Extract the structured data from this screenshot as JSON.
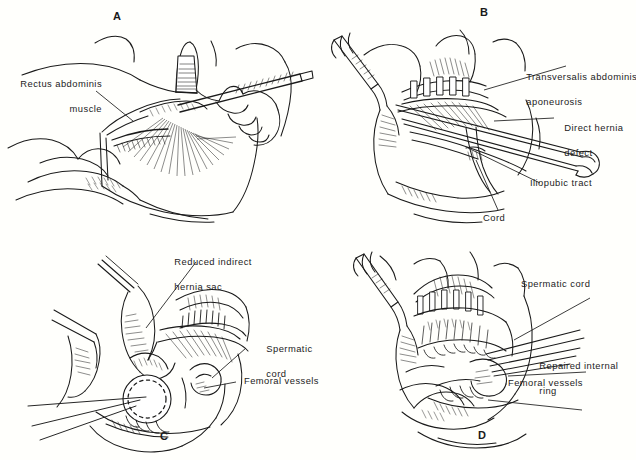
{
  "figure": {
    "background_color": "#fffffc",
    "ink_color": "#1a1a1a",
    "text_color": "#1c1c1c"
  },
  "panels": [
    {
      "id": "A",
      "letter": "A",
      "letter_position": "top",
      "caption": "Rectus abdominis muscle exposed; surgeon incises with scalpel",
      "labels": [
        {
          "name": "rectus-abdominis-muscle",
          "line1": "Rectus abdominis",
          "line2": "muscle"
        }
      ]
    },
    {
      "id": "B",
      "letter": "B",
      "letter_position": "top",
      "caption": "Direct hernia defect demonstrated with forceps and retractor",
      "labels": [
        {
          "name": "transversalis-abdominis-aponeurosis",
          "line1": "Transversalis abdominis",
          "line2": "aponeurosis"
        },
        {
          "name": "direct-hernia-defect",
          "line1": "Direct hernia",
          "line2": "defect"
        },
        {
          "name": "iliopubic-tract",
          "line1": "Iliopubic tract",
          "line2": ""
        },
        {
          "name": "cord",
          "line1": "Cord",
          "line2": ""
        }
      ]
    },
    {
      "id": "C",
      "letter": "C",
      "letter_position": "bottom",
      "caption": "Reduced indirect hernia sac with internal ring sutured",
      "labels": [
        {
          "name": "reduced-indirect-hernia-sac",
          "line1": "Reduced indirect",
          "line2": "hernia sac"
        },
        {
          "name": "spermatic-cord",
          "line1": "Spermatic",
          "line2": "cord"
        },
        {
          "name": "femoral-vessels",
          "line1": "Femoral vessels",
          "line2": ""
        }
      ]
    },
    {
      "id": "D",
      "letter": "D",
      "letter_position": "bottom",
      "caption": "Completed repair with reconstructed internal ring",
      "labels": [
        {
          "name": "spermatic-cord",
          "line1": "Spermatic cord",
          "line2": ""
        },
        {
          "name": "repaired-internal-ring",
          "line1": "Repaired internal",
          "line2": "ring"
        },
        {
          "name": "femoral-vessels",
          "line1": "Femoral vessels",
          "line2": ""
        }
      ]
    }
  ]
}
